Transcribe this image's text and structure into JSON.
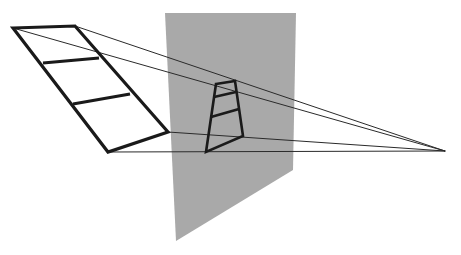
{
  "diagram": {
    "title": "",
    "colors": {
      "background": "#ffffff",
      "picture_plane": "#a9a9a9",
      "frame_stroke": "#1a1a1a",
      "projection_ray": "#2a2a2a"
    },
    "elements": {
      "object_frame": {
        "label": "",
        "rungs": 2,
        "panels": 3
      },
      "projected_frame": {
        "label": "",
        "rungs": 2,
        "panels": 3
      },
      "picture_plane": {
        "label": ""
      },
      "viewpoint": {
        "label": ""
      },
      "projection_rays": {
        "count": 4
      }
    }
  }
}
